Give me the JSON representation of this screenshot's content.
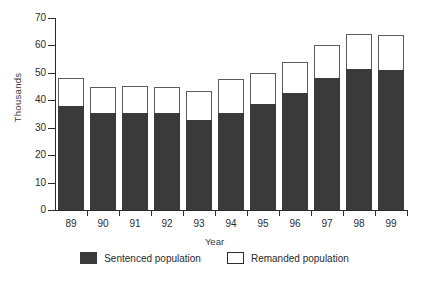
{
  "chart_data": {
    "type": "bar",
    "subtype": "stacked-vertical",
    "title": "",
    "xlabel": "Year",
    "ylabel": "Thousands",
    "ylim": [
      0,
      70
    ],
    "ytick_values": [
      70,
      60,
      50,
      40,
      30,
      20,
      10,
      0
    ],
    "ytick_labels": [
      "70",
      "60",
      "50",
      "40",
      "30",
      "20",
      "10",
      "0"
    ],
    "grid": false,
    "legend_position": "bottom",
    "categories": [
      "89",
      "90",
      "91",
      "92",
      "93",
      "94",
      "95",
      "96",
      "97",
      "98",
      "99"
    ],
    "series": [
      {
        "name": "Sentenced population",
        "color": "#3a3a3a",
        "values": [
          38.0,
          35.5,
          35.5,
          35.2,
          33.0,
          35.5,
          38.8,
          42.5,
          48.0,
          51.5,
          51.0
        ]
      },
      {
        "name": "Remanded population",
        "color": "#ffffff",
        "values": [
          10.0,
          9.5,
          9.8,
          9.8,
          10.5,
          12.2,
          11.2,
          11.5,
          12.0,
          12.7,
          12.8
        ]
      }
    ],
    "totals": [
      48.0,
      45.0,
      45.3,
      45.0,
      43.5,
      47.7,
      50.0,
      54.0,
      60.0,
      64.2,
      63.8
    ]
  },
  "legend": {
    "items": [
      {
        "label": "Sentenced population",
        "swatch": "filled-dark-swatch"
      },
      {
        "label": "Remanded population",
        "swatch": "outlined-white-swatch"
      }
    ]
  },
  "axes": {
    "x_title": "Year",
    "y_title": "Thousands"
  },
  "colors": {
    "sentenced": "#3a3a3a",
    "remanded": "#ffffff",
    "axis": "#2b2b2b",
    "background": "#ffffff"
  }
}
